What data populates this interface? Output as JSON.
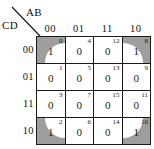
{
  "figure": {
    "type": "karnaugh-map",
    "variables_columns_label": "AB",
    "variables_rows_label": "CD",
    "column_headers": [
      "00",
      "01",
      "11",
      "10"
    ],
    "row_headers": [
      "00",
      "01",
      "11",
      "10"
    ],
    "grouping_note": "four-corner group",
    "colors": {
      "group_fill": "#9e9e9e",
      "cell_fill": "#ffffff",
      "grid_line": "#1a1a1a",
      "text": "#1a1a1a"
    }
  },
  "cells": [
    [
      {
        "index": "0",
        "value": "1",
        "shaded": true,
        "arc": "tl"
      },
      {
        "index": "4",
        "value": "0",
        "shaded": false,
        "arc": ""
      },
      {
        "index": "12",
        "value": "0",
        "shaded": false,
        "arc": ""
      },
      {
        "index": "8",
        "value": "1",
        "shaded": true,
        "arc": "tr"
      }
    ],
    [
      {
        "index": "1",
        "value": "0",
        "shaded": false,
        "arc": ""
      },
      {
        "index": "5",
        "value": "0",
        "shaded": false,
        "arc": ""
      },
      {
        "index": "13",
        "value": "0",
        "shaded": false,
        "arc": ""
      },
      {
        "index": "9",
        "value": "0",
        "shaded": false,
        "arc": ""
      }
    ],
    [
      {
        "index": "3",
        "value": "0",
        "shaded": false,
        "arc": ""
      },
      {
        "index": "7",
        "value": "0",
        "shaded": false,
        "arc": ""
      },
      {
        "index": "15",
        "value": "0",
        "shaded": false,
        "arc": ""
      },
      {
        "index": "11",
        "value": "0",
        "shaded": false,
        "arc": ""
      }
    ],
    [
      {
        "index": "2",
        "value": "1",
        "shaded": true,
        "arc": "bl"
      },
      {
        "index": "6",
        "value": "0",
        "shaded": false,
        "arc": ""
      },
      {
        "index": "14",
        "value": "0",
        "shaded": false,
        "arc": ""
      },
      {
        "index": "10",
        "value": "1",
        "shaded": true,
        "arc": "br"
      }
    ]
  ]
}
